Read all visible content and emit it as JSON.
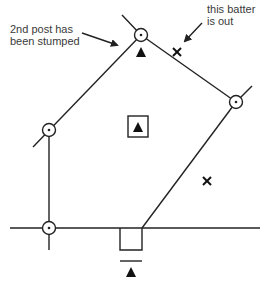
{
  "diagram": {
    "annotations": {
      "left": {
        "line1": "2nd post has",
        "line2": "been stumped"
      },
      "right": {
        "line1": "this batter",
        "line2": "is out"
      }
    },
    "legend_symbols": {
      "post": "circle-with-dot",
      "fielder": "filled-triangle",
      "out_batter": "x-mark",
      "bowler_square": "square-with-triangle",
      "batting_square": "open-square"
    },
    "colors": {
      "line": "#222222",
      "text": "#3a3a3a",
      "background": "#ffffff"
    }
  }
}
